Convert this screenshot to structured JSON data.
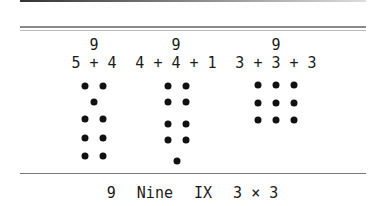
{
  "columns": [
    {
      "total": "9",
      "expression": "5 + 4",
      "center_x": 94
    },
    {
      "total": "9",
      "expression": "4 + 4 + 1",
      "center_x": 175
    },
    {
      "total": "9",
      "expression": "3 + 3 + 3",
      "center_x": 276
    }
  ],
  "footer": {
    "numeral": "9",
    "word": "Nine",
    "roman": "IX",
    "product": "3 × 3"
  }
}
